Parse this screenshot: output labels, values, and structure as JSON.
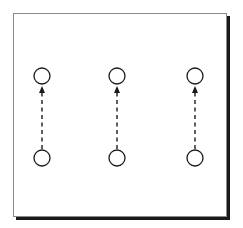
{
  "diagram": {
    "title": "",
    "colors": {
      "stroke": "#1a1a1a",
      "frame": "#7a7a7a",
      "shadow": "#1a1a1a",
      "background": "#ffffff"
    },
    "columns": [
      {
        "id": "col-1",
        "top_node": "node-1-top",
        "bottom_node": "node-1-bottom",
        "arrow": {
          "from": "bottom",
          "to": "top",
          "style": "dashed"
        }
      },
      {
        "id": "col-2",
        "top_node": "node-2-top",
        "bottom_node": "node-2-bottom",
        "arrow": {
          "from": "bottom",
          "to": "top",
          "style": "dashed"
        }
      },
      {
        "id": "col-3",
        "top_node": "node-3-top",
        "bottom_node": "node-3-bottom",
        "arrow": {
          "from": "bottom",
          "to": "top",
          "style": "dashed"
        }
      }
    ]
  }
}
